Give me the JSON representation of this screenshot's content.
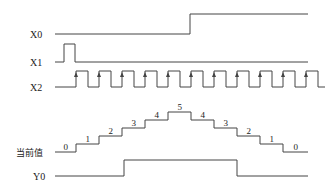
{
  "diagram": {
    "type": "timing-diagram",
    "signals": [
      {
        "id": "X0",
        "label": "X0",
        "description": "reset/direction input",
        "levels": "low until after 5th count pulse, then high"
      },
      {
        "id": "X1",
        "label": "X1",
        "description": "single short pulse at start"
      },
      {
        "id": "X2",
        "label": "X2",
        "description": "clock pulses",
        "pulse_count": 11,
        "rising_edge_markers": true
      },
      {
        "id": "current",
        "label": "当前值",
        "description": "counter current value",
        "values": [
          0,
          1,
          2,
          3,
          4,
          5,
          4,
          3,
          2,
          1,
          0
        ]
      },
      {
        "id": "Y0",
        "label": "Y0",
        "description": "output",
        "levels": "high while current value >= 2 during counting"
      }
    ],
    "colors": {
      "line": "#444444",
      "text": "#222222",
      "background": "#ffffff"
    }
  }
}
